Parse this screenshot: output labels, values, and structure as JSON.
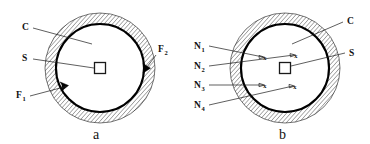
{
  "figure": {
    "background_color": "#ffffff",
    "ink_color": "#111111",
    "panels": [
      {
        "id": "panel-a",
        "caption": "a",
        "center": {
          "x": 100,
          "y": 68
        },
        "inner_radius": 44,
        "outer_radius": 55,
        "core_label": "s",
        "labels": [
          {
            "name": "c",
            "text": "C",
            "sub": "",
            "x": 22,
            "y": 30
          },
          {
            "name": "s",
            "text": "S",
            "sub": "",
            "x": 22,
            "y": 61
          },
          {
            "name": "f1",
            "text": "F",
            "sub": "1",
            "x": 16,
            "y": 98
          },
          {
            "name": "f2",
            "text": "F",
            "sub": "2",
            "x": 158,
            "y": 52
          }
        ],
        "markers": [
          {
            "name": "marker-f2",
            "angle_deg": 5
          },
          {
            "name": "marker-f1",
            "angle_deg": 203
          }
        ]
      },
      {
        "id": "panel-b",
        "caption": "b",
        "center": {
          "x": 285,
          "y": 68
        },
        "inner_radius": 44,
        "outer_radius": 55,
        "core_label": "s",
        "labels": [
          {
            "name": "n1",
            "text": "N",
            "sub": "1",
            "x": 196,
            "y": 49
          },
          {
            "name": "n2",
            "text": "N",
            "sub": "2",
            "x": 196,
            "y": 69
          },
          {
            "name": "n3",
            "text": "N",
            "sub": "3",
            "x": 196,
            "y": 88
          },
          {
            "name": "n4",
            "text": "N",
            "sub": "4",
            "x": 196,
            "y": 108
          },
          {
            "name": "c",
            "text": "C",
            "sub": "",
            "x": 348,
            "y": 24
          },
          {
            "name": "s",
            "text": "S",
            "sub": "",
            "x": 350,
            "y": 55
          }
        ],
        "x_marks": [
          {
            "name": "x-mark-1",
            "x": 266,
            "y": 57
          },
          {
            "name": "x-mark-2",
            "x": 297,
            "y": 55
          },
          {
            "name": "x-mark-3",
            "x": 266,
            "y": 85
          },
          {
            "name": "x-mark-4",
            "x": 296,
            "y": 86
          }
        ],
        "x_symbol": "x"
      }
    ]
  }
}
